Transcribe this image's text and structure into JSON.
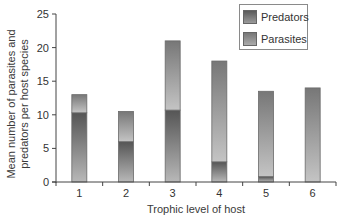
{
  "chart_data": {
    "type": "bar",
    "stacked": true,
    "title": "",
    "xlabel": "Trophic level of host",
    "ylabel_lines": [
      "Mean number of parasites and",
      "predators per host species"
    ],
    "ylabel": "Mean number of parasites and predators per host species",
    "categories": [
      "1",
      "2",
      "3",
      "4",
      "5",
      "6"
    ],
    "series": [
      {
        "name": "Predators",
        "values": [
          10.3,
          6.0,
          10.7,
          3.0,
          0.8,
          0.0
        ],
        "color_top": "#555555",
        "color_bottom": "#b8b8b8"
      },
      {
        "name": "Parasites",
        "values": [
          2.7,
          4.5,
          10.3,
          15.0,
          12.7,
          14.0
        ],
        "color_top": "#777777",
        "color_bottom": "#c4c4c4"
      }
    ],
    "totals": [
      13.0,
      10.5,
      21.0,
      18.0,
      13.5,
      14.0
    ],
    "ylim": [
      0,
      25
    ],
    "yticks": [
      0,
      5,
      10,
      15,
      20,
      25
    ],
    "grid": false,
    "legend_position": "top-right",
    "legend": [
      "Predators",
      "Parasites"
    ]
  }
}
